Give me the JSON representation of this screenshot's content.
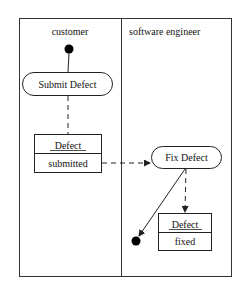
{
  "diagram": {
    "type": "uml-activity-swimlane",
    "lanes": [
      {
        "id": "customer",
        "label": "customer"
      },
      {
        "id": "engineer",
        "label": "software engineer"
      }
    ],
    "nodes": {
      "initial": {
        "kind": "initial",
        "lane": "customer"
      },
      "submit": {
        "kind": "action",
        "label": "Submit Defect",
        "lane": "customer"
      },
      "obj_submitted": {
        "kind": "object",
        "name": "Defect",
        "state": "submitted",
        "lane": "customer"
      },
      "fix": {
        "kind": "action",
        "label": "Fix Defect",
        "lane": "engineer"
      },
      "obj_fixed": {
        "kind": "object",
        "name": "Defect",
        "state": "fixed",
        "lane": "engineer"
      },
      "final": {
        "kind": "final",
        "lane": "engineer"
      }
    },
    "edges": [
      {
        "from": "initial",
        "to": "submit",
        "style": "solid"
      },
      {
        "from": "submit",
        "to": "obj_submitted",
        "style": "dashed"
      },
      {
        "from": "obj_submitted",
        "to": "fix",
        "style": "dashed",
        "arrow": true
      },
      {
        "from": "fix",
        "to": "obj_fixed",
        "style": "dashed",
        "arrow": true
      },
      {
        "from": "fix",
        "to": "final",
        "style": "solid",
        "arrow": true
      }
    ],
    "colors": {
      "line": "#222222",
      "fill": "#ffffff",
      "node": "#000000"
    }
  }
}
